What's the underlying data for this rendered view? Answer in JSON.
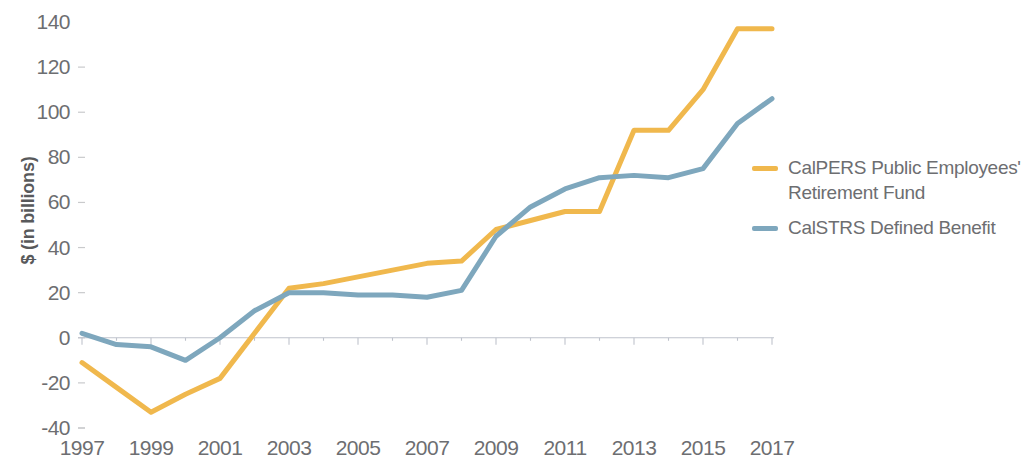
{
  "chart_data": {
    "type": "line",
    "title": "",
    "subtitle": "",
    "xlabel": "",
    "ylabel": "$ (in billions)",
    "x": [
      1997,
      1998,
      1999,
      2000,
      2001,
      2002,
      2003,
      2004,
      2005,
      2006,
      2007,
      2008,
      2009,
      2010,
      2011,
      2012,
      2013,
      2014,
      2015,
      2016,
      2017
    ],
    "xtick_labels": [
      "1997",
      "1999",
      "2001",
      "2003",
      "2005",
      "2007",
      "2009",
      "2011",
      "2013",
      "2015",
      "2017"
    ],
    "xtick_values": [
      1997,
      1999,
      2001,
      2003,
      2005,
      2007,
      2009,
      2011,
      2013,
      2015,
      2017
    ],
    "ytick_labels": [
      "140",
      "120",
      "100",
      "80",
      "60",
      "40",
      "20",
      "0",
      "-20",
      "-40"
    ],
    "ytick_values": [
      140,
      120,
      100,
      80,
      60,
      40,
      20,
      0,
      -20,
      -40
    ],
    "xlim": [
      1997,
      2017
    ],
    "ylim": [
      -40,
      140
    ],
    "grid": false,
    "zero_line": true,
    "legend_position": "right",
    "series": [
      {
        "name": "CalPERS Public Employees' Retirement Fund",
        "color": "#f0b84d",
        "values": [
          -11,
          -22,
          -33,
          -25,
          -18,
          2,
          22,
          24,
          27,
          30,
          33,
          34,
          48,
          52,
          56,
          56,
          92,
          92,
          110,
          137,
          137
        ]
      },
      {
        "name": "CalSTRS Defined Benefit",
        "color": "#7ea7bd",
        "values": [
          2,
          -3,
          -4,
          -10,
          0,
          12,
          20,
          20,
          19,
          19,
          18,
          21,
          45,
          58,
          66,
          71,
          72,
          71,
          75,
          95,
          106
        ]
      }
    ]
  },
  "legend": {
    "items": [
      {
        "label_line1": "CalPERS Public Employees'",
        "label_line2": "Retirement Fund",
        "color": "#f0b84d"
      },
      {
        "label_line1": "CalSTRS Defined Benefit",
        "label_line2": "",
        "color": "#7ea7bd"
      }
    ]
  },
  "colors": {
    "calpers": "#f0b84d",
    "calstrs": "#7ea7bd",
    "axis": "#c9cacc",
    "text": "#6d6e71"
  }
}
